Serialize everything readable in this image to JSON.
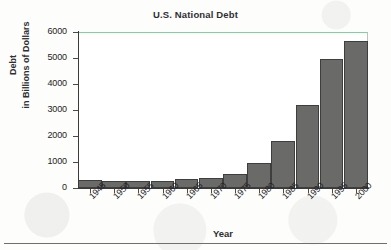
{
  "chart_data": {
    "type": "bar",
    "title": "U.S. National Debt",
    "xlabel": "Year",
    "ylabel": "Debt\nin Billions of Dollars",
    "ylabel_lines": [
      "Debt",
      "in Billions of Dollars"
    ],
    "categories": [
      "1945",
      "1950",
      "1955",
      "1960",
      "1965",
      "1970",
      "1975",
      "1980",
      "1985",
      "1990",
      "1995",
      "2000"
    ],
    "values": [
      300,
      280,
      280,
      290,
      330,
      390,
      550,
      950,
      1800,
      3200,
      4950,
      5650
    ],
    "ylim": [
      0,
      6000
    ],
    "yticks": [
      0,
      1000,
      2000,
      3000,
      4000,
      5000,
      6000
    ],
    "ytick_labels": [
      "0",
      "1000",
      "2000",
      "3000",
      "4000",
      "5000",
      "6000"
    ],
    "grid": false,
    "legend": false,
    "bar_color": "#6a6a68",
    "bar_edge_color": "#3e3e3e",
    "plot_background": "#ffffff",
    "axis_color": "#3a3a3a",
    "top_border_color": "#7fd39a"
  }
}
